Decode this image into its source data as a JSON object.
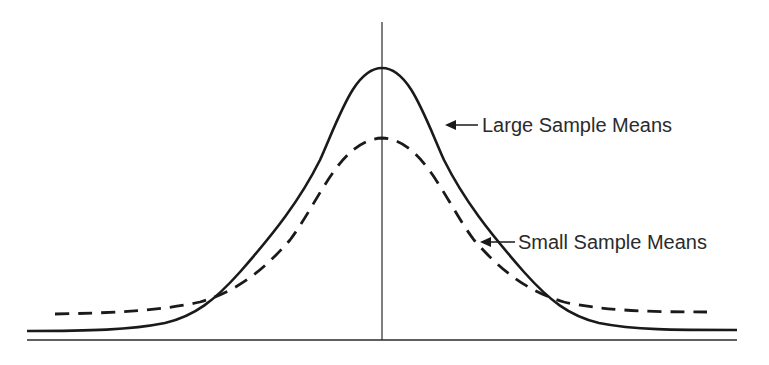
{
  "figure": {
    "labels": {
      "large": "Large Sample Means",
      "small": "Small Sample Means"
    },
    "curves": [
      {
        "name": "Large Sample Means",
        "style": "solid",
        "peak_y_px": 68,
        "relative_height": 1.0
      },
      {
        "name": "Small Sample Means",
        "style": "dashed",
        "peak_y_px": 138,
        "relative_height": 0.74
      }
    ],
    "colors": {
      "ink": "#1a1a1a",
      "text": "#2b2b2b",
      "background": "#ffffff"
    }
  }
}
